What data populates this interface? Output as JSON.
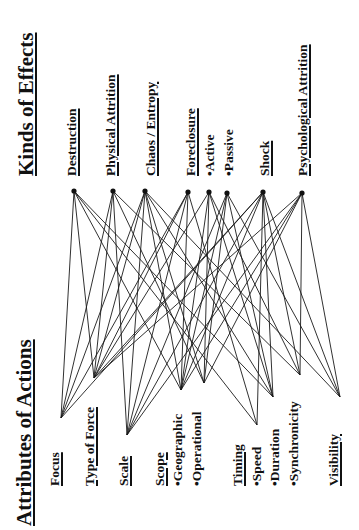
{
  "effects_panel": {
    "title": "Kinds of Effects",
    "items": [
      {
        "id": "destruction",
        "label": "Destruction",
        "underline": true
      },
      {
        "id": "physical",
        "label": "Physical Attrition",
        "underline": true
      },
      {
        "id": "chaos",
        "label": "Chaos / Entropy",
        "underline": true
      },
      {
        "id": "foreclosure",
        "label": "Foreclosure",
        "underline": true
      },
      {
        "id": "active",
        "label": "•Active",
        "underline": false
      },
      {
        "id": "passive",
        "label": "•Passive",
        "underline": false
      },
      {
        "id": "shock",
        "label": "Shock",
        "underline": true
      },
      {
        "id": "psych",
        "label": "Psychological Attrition",
        "underline": true
      }
    ]
  },
  "attributes_panel": {
    "title": "Attributes of Actions",
    "items": [
      {
        "id": "focus",
        "label": "Focus",
        "underline": true
      },
      {
        "id": "force",
        "label": "Type of Force",
        "underline": true
      },
      {
        "id": "scale",
        "label": "Scale",
        "underline": true
      },
      {
        "id": "scope",
        "label": "Scope",
        "underline": true
      },
      {
        "id": "geographic",
        "label": "•Geographic",
        "underline": false
      },
      {
        "id": "operational",
        "label": "•Operational",
        "underline": false
      },
      {
        "id": "timing",
        "label": "Timing",
        "underline": true
      },
      {
        "id": "speed",
        "label": "•Speed",
        "underline": false
      },
      {
        "id": "duration",
        "label": "•Duration",
        "underline": false
      },
      {
        "id": "synchronicity",
        "label": "•Synchronicity",
        "underline": false
      },
      {
        "id": "visibility",
        "label": "Visibility",
        "underline": true
      }
    ]
  },
  "nodes": {
    "top": {
      "destruction": [
        74,
        191
      ],
      "physical": [
        113,
        191
      ],
      "chaos": [
        145,
        191
      ],
      "foreclosure": [
        188,
        192
      ],
      "active": [
        209,
        192
      ],
      "passive": [
        227,
        193
      ],
      "shock": [
        263,
        192
      ],
      "psych": [
        302,
        193
      ]
    },
    "bottom": {
      "focus": [
        61,
        418
      ],
      "force": [
        94,
        378
      ],
      "scale": [
        127,
        435
      ],
      "geographic": [
        181,
        390
      ],
      "operational": [
        204,
        383
      ],
      "speed": [
        257,
        425
      ],
      "duration": [
        273,
        397
      ],
      "synchronicity": [
        300,
        375
      ],
      "visibility": [
        340,
        397
      ]
    }
  },
  "edges": [
    [
      "destruction",
      "focus"
    ],
    [
      "destruction",
      "force"
    ],
    [
      "destruction",
      "geographic"
    ],
    [
      "destruction",
      "speed"
    ],
    [
      "destruction",
      "duration"
    ],
    [
      "physical",
      "focus"
    ],
    [
      "physical",
      "force"
    ],
    [
      "physical",
      "scale"
    ],
    [
      "physical",
      "operational"
    ],
    [
      "physical",
      "synchronicity"
    ],
    [
      "chaos",
      "focus"
    ],
    [
      "chaos",
      "force"
    ],
    [
      "chaos",
      "scale"
    ],
    [
      "chaos",
      "geographic"
    ],
    [
      "chaos",
      "operational"
    ],
    [
      "chaos",
      "duration"
    ],
    [
      "chaos",
      "visibility"
    ],
    [
      "foreclosure",
      "focus"
    ],
    [
      "foreclosure",
      "force"
    ],
    [
      "foreclosure",
      "scale"
    ],
    [
      "foreclosure",
      "geographic"
    ],
    [
      "foreclosure",
      "speed"
    ],
    [
      "active",
      "force"
    ],
    [
      "active",
      "geographic"
    ],
    [
      "active",
      "operational"
    ],
    [
      "active",
      "duration"
    ],
    [
      "active",
      "synchronicity"
    ],
    [
      "passive",
      "scale"
    ],
    [
      "passive",
      "geographic"
    ],
    [
      "passive",
      "operational"
    ],
    [
      "passive",
      "duration"
    ],
    [
      "passive",
      "visibility"
    ],
    [
      "shock",
      "focus"
    ],
    [
      "shock",
      "force"
    ],
    [
      "shock",
      "scale"
    ],
    [
      "shock",
      "geographic"
    ],
    [
      "shock",
      "speed"
    ],
    [
      "shock",
      "duration"
    ],
    [
      "shock",
      "synchronicity"
    ],
    [
      "shock",
      "visibility"
    ],
    [
      "psych",
      "force"
    ],
    [
      "psych",
      "scale"
    ],
    [
      "psych",
      "geographic"
    ],
    [
      "psych",
      "operational"
    ],
    [
      "psych",
      "synchronicity"
    ],
    [
      "psych",
      "visibility"
    ]
  ]
}
